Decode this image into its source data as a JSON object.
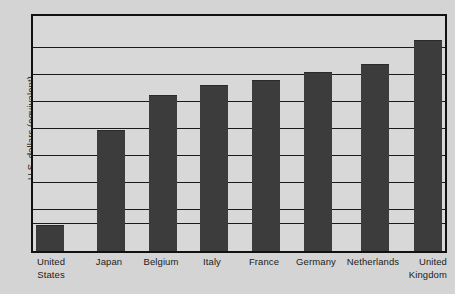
{
  "chart_data": {
    "type": "bar",
    "title": "",
    "subtitle": "",
    "xlabel": "",
    "ylabel": "U.S. dollars (equivalent)",
    "categories": [
      "United States",
      "Japan",
      "Belgium",
      "Italy",
      "France",
      "Germany",
      "Netherlands",
      "United Kingdom"
    ],
    "category_lines": [
      [
        "United",
        "States"
      ],
      [
        "Japan",
        ""
      ],
      [
        "Belgium",
        ""
      ],
      [
        "Italy",
        ""
      ],
      [
        "France",
        ""
      ],
      [
        "Germany",
        ""
      ],
      [
        "Netherlands",
        ""
      ],
      [
        "United",
        "Kingdom"
      ]
    ],
    "values": [
      1.0,
      4.65,
      6.0,
      6.4,
      6.6,
      6.9,
      7.2,
      8.1
    ],
    "ylim": [
      0,
      9.2
    ],
    "yticks": [
      0,
      1.35,
      2.7,
      4.1,
      5.45,
      6.8,
      8.15
    ],
    "ytick_labels": [
      "",
      "",
      "",
      "",
      "",
      "",
      ""
    ],
    "grid": true,
    "legend": "none",
    "bar_color": "#3c3c3c",
    "plot_background": "#d8d8d8",
    "page_background": "#d4d4d4",
    "axis_color": "#111111",
    "gridline_color": "#1a1a1a"
  },
  "layout": {
    "gridline_y_px": [
      31,
      58,
      85,
      112,
      139,
      166,
      193,
      207
    ],
    "bar_geometry": [
      {
        "name": "United States",
        "left_px": 3,
        "width_px": 28,
        "height_px": 26
      },
      {
        "name": "Japan",
        "left_px": 64,
        "width_px": 28,
        "height_px": 121
      },
      {
        "name": "Belgium",
        "left_px": 116,
        "width_px": 28,
        "height_px": 156
      },
      {
        "name": "Italy",
        "left_px": 167,
        "width_px": 28,
        "height_px": 166
      },
      {
        "name": "France",
        "left_px": 219,
        "width_px": 28,
        "height_px": 171
      },
      {
        "name": "Germany",
        "left_px": 271,
        "width_px": 28,
        "height_px": 179
      },
      {
        "name": "Netherlands",
        "left_px": 328,
        "width_px": 28,
        "height_px": 187
      },
      {
        "name": "United Kingdom",
        "left_px": 381,
        "width_px": 28,
        "height_px": 211
      }
    ],
    "label_geometry": [
      {
        "left_px": -8,
        "width_px": 56
      },
      {
        "left_px": 50,
        "width_px": 56
      },
      {
        "left_px": 100,
        "width_px": 60
      },
      {
        "left_px": 153,
        "width_px": 56
      },
      {
        "left_px": 203,
        "width_px": 60
      },
      {
        "left_px": 253,
        "width_px": 64
      },
      {
        "left_px": 301,
        "width_px": 82
      },
      {
        "left_px": 360,
        "width_px": 56
      }
    ]
  }
}
